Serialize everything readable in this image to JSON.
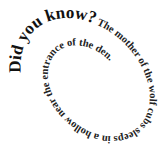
{
  "spiral": {
    "lead_text": "Did you know?",
    "body_text": " The mother of the wolf cubs sleeps in a hollow near the entrance of the den."
  },
  "colors": {
    "background": "#ffffff",
    "text": "#111111"
  }
}
